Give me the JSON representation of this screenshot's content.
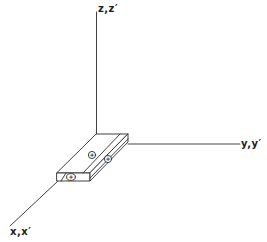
{
  "diagram": {
    "type": "3d-coordinate-axes-with-slab",
    "axes": {
      "z": {
        "label": "z,z′"
      },
      "y": {
        "label": "y,y′"
      },
      "x": {
        "label": "x,x′"
      }
    },
    "slab": {
      "description": "rectangular slab at origin with positive charges",
      "charges": [
        {
          "symbol": "+"
        },
        {
          "symbol": "+"
        },
        {
          "symbol": "+"
        }
      ]
    },
    "colors": {
      "line": "#2a2a2a",
      "background": "#ffffff"
    }
  }
}
